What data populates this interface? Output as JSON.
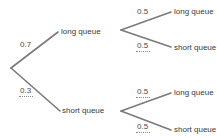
{
  "diagram": {
    "type": "probability-tree",
    "line_color": "#7a7a7a",
    "text_color": "#3a3a3a",
    "level1": [
      {
        "outcome": "long queue",
        "probability": "0.7",
        "filled_answer": false
      },
      {
        "outcome": "short queue",
        "probability": "0.3",
        "filled_answer": true
      }
    ],
    "level2": {
      "after_long_queue": [
        {
          "outcome": "long queue",
          "probability": "0.5",
          "filled_answer": false
        },
        {
          "outcome": "short queue",
          "probability": "0.5",
          "filled_answer": true
        }
      ],
      "after_short_queue": [
        {
          "outcome": "long queue",
          "probability": "0.5",
          "filled_answer": true
        },
        {
          "outcome": "short queue",
          "probability": "0.5",
          "filled_answer": true
        }
      ]
    }
  }
}
